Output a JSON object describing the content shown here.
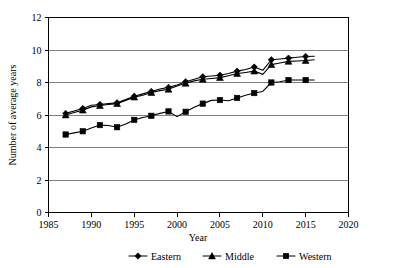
{
  "chart_data": {
    "type": "line",
    "title": "",
    "xlabel": "Year",
    "ylabel": "Number of average years",
    "xlim": [
      1985,
      2020
    ],
    "ylim": [
      0,
      12
    ],
    "xticks": [
      "1985",
      "1990",
      "1995",
      "2000",
      "2005",
      "2010",
      "2015",
      "2020"
    ],
    "yticks": [
      "0",
      "2",
      "4",
      "6",
      "8",
      "10",
      "12"
    ],
    "grid": "horizontal",
    "legend_position": "bottom",
    "x": [
      1987,
      1988,
      1989,
      1990,
      1991,
      1992,
      1993,
      1994,
      1995,
      1996,
      1997,
      1998,
      1999,
      2000,
      2001,
      2002,
      2003,
      2004,
      2005,
      2006,
      2007,
      2008,
      2009,
      2010,
      2011,
      2012,
      2013,
      2014,
      2015,
      2016
    ],
    "series": [
      {
        "name": "Eastern",
        "marker": "diamond",
        "values": [
          6.1,
          6.25,
          6.4,
          6.6,
          6.65,
          6.7,
          6.75,
          6.95,
          7.15,
          7.3,
          7.45,
          7.6,
          7.7,
          7.85,
          8.05,
          8.2,
          8.35,
          8.4,
          8.45,
          8.55,
          8.7,
          8.8,
          8.95,
          8.75,
          9.4,
          9.45,
          9.5,
          9.55,
          9.6,
          9.62
        ]
      },
      {
        "name": "Middle",
        "marker": "triangle",
        "values": [
          6.0,
          6.15,
          6.3,
          6.5,
          6.58,
          6.65,
          6.7,
          6.9,
          7.1,
          7.22,
          7.38,
          7.5,
          7.58,
          7.78,
          7.95,
          8.1,
          8.2,
          8.25,
          8.3,
          8.42,
          8.55,
          8.62,
          8.7,
          8.5,
          9.1,
          9.2,
          9.3,
          9.32,
          9.35,
          9.4
        ]
      },
      {
        "name": "Western",
        "marker": "square",
        "values": [
          4.8,
          4.9,
          5.0,
          5.2,
          5.38,
          5.35,
          5.25,
          5.45,
          5.7,
          5.85,
          5.95,
          6.1,
          6.22,
          5.9,
          6.2,
          6.48,
          6.7,
          6.9,
          6.92,
          6.88,
          7.05,
          7.22,
          7.35,
          7.45,
          8.0,
          8.05,
          8.15,
          8.15,
          8.15,
          8.15
        ]
      }
    ]
  },
  "legend": {
    "items": [
      {
        "label": "Eastern"
      },
      {
        "label": "Middle"
      },
      {
        "label": "Western"
      }
    ]
  }
}
